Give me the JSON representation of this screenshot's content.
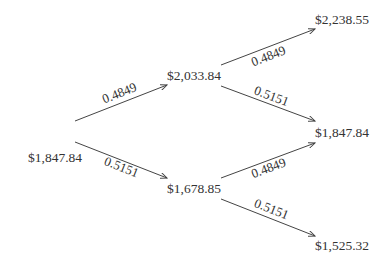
{
  "diagram": {
    "type": "binomial-tree",
    "nodes": [
      {
        "id": "root",
        "label": "$1,847.84",
        "x": 55,
        "y": 162
      },
      {
        "id": "up",
        "label": "$2,033.84",
        "x": 194,
        "y": 80
      },
      {
        "id": "down",
        "label": "$1,678.85",
        "x": 194,
        "y": 193
      },
      {
        "id": "upup",
        "label": "$2,238.55",
        "x": 342,
        "y": 24
      },
      {
        "id": "updown",
        "label": "$1,847.84",
        "x": 342,
        "y": 137
      },
      {
        "id": "downdown",
        "label": "$1,525.32",
        "x": 342,
        "y": 250
      }
    ],
    "edges": [
      {
        "from": "root",
        "to": "up",
        "prob": "0.4849",
        "x1": 75,
        "y1": 121,
        "x2": 167,
        "y2": 85,
        "lx": 121,
        "ly": 97
      },
      {
        "from": "root",
        "to": "down",
        "prob": "0.5151",
        "x1": 75,
        "y1": 142,
        "x2": 167,
        "y2": 178,
        "lx": 120,
        "ly": 171
      },
      {
        "from": "up",
        "to": "upup",
        "prob": "0.4849",
        "x1": 221,
        "y1": 65,
        "x2": 315,
        "y2": 29,
        "lx": 270,
        "ly": 60
      },
      {
        "from": "up",
        "to": "updown",
        "prob": "0.5151",
        "x1": 221,
        "y1": 86,
        "x2": 315,
        "y2": 121,
        "lx": 270,
        "ly": 100
      },
      {
        "from": "down",
        "to": "updown",
        "prob": "0.4849",
        "x1": 221,
        "y1": 178,
        "x2": 315,
        "y2": 143,
        "lx": 270,
        "ly": 172
      },
      {
        "from": "down",
        "to": "downdown",
        "prob": "0.5151",
        "x1": 221,
        "y1": 199,
        "x2": 315,
        "y2": 236,
        "lx": 270,
        "ly": 213
      }
    ]
  }
}
